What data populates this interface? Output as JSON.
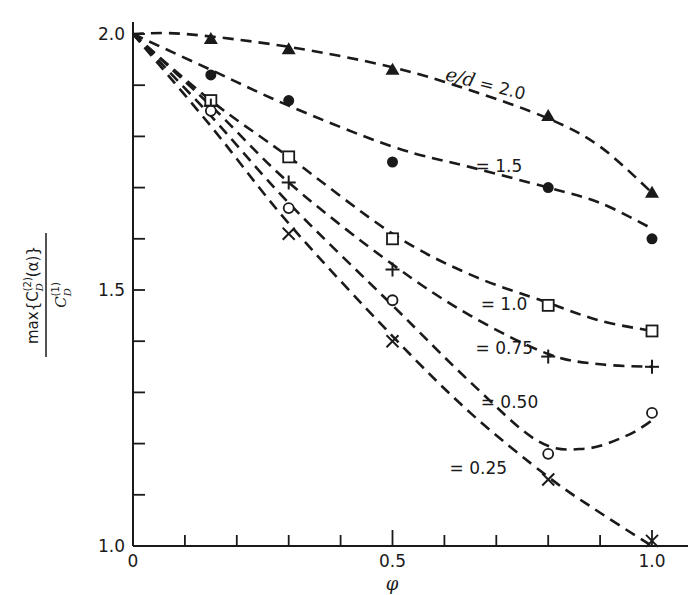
{
  "chart_data": {
    "type": "line",
    "title": "",
    "xlabel": "φ",
    "ylabel": "max{C_D^(2)(α)} / C_D^(1)",
    "ylabel_parts": {
      "numerator": "max{C",
      "num_sup": "(2)",
      "num_sub": "D",
      "num_tail": "(α)}",
      "denominator": "C",
      "den_sup": "(1)",
      "den_sub": "D"
    },
    "xlim": [
      0,
      1.0
    ],
    "ylim": [
      1.0,
      2.0
    ],
    "grid": false,
    "legend_position": "inline labels on curves",
    "x_ticks": [
      0,
      0.1,
      0.2,
      0.3,
      0.4,
      0.5,
      0.6,
      0.7,
      0.8,
      0.9,
      1.0
    ],
    "x_tick_labels": [
      {
        "value": 0,
        "label": "0"
      },
      {
        "value": 0.5,
        "label": "0.5"
      },
      {
        "value": 1.0,
        "label": "1.0"
      }
    ],
    "y_ticks": [
      1.0,
      1.1,
      1.2,
      1.3,
      1.4,
      1.5,
      1.6,
      1.7,
      1.8,
      1.9,
      2.0
    ],
    "y_tick_labels": [
      {
        "value": 1.0,
        "label": "1.0"
      },
      {
        "value": 1.5,
        "label": "1.5"
      },
      {
        "value": 2.0,
        "label": "2.0"
      }
    ],
    "x": [
      0.15,
      0.3,
      0.5,
      0.8,
      1.0
    ],
    "series": [
      {
        "name": "e/d = 2.0",
        "label": "e/d = 2.0",
        "marker": "filled-triangle",
        "values": [
          1.99,
          1.97,
          1.93,
          1.84,
          1.69
        ],
        "curve": [
          [
            0,
            2.0
          ],
          [
            0.1,
            2.0
          ],
          [
            0.3,
            1.975
          ],
          [
            0.5,
            1.935
          ],
          [
            0.65,
            1.89
          ],
          [
            0.8,
            1.835
          ],
          [
            0.9,
            1.78
          ],
          [
            1.0,
            1.69
          ]
        ]
      },
      {
        "name": "e/d = 1.5",
        "label": "= 1.5",
        "marker": "filled-circle",
        "values": [
          1.92,
          1.87,
          1.75,
          1.7,
          1.6
        ],
        "curve": [
          [
            0,
            2.0
          ],
          [
            0.15,
            1.93
          ],
          [
            0.3,
            1.86
          ],
          [
            0.5,
            1.78
          ],
          [
            0.65,
            1.74
          ],
          [
            0.8,
            1.7
          ],
          [
            0.9,
            1.67
          ],
          [
            1.0,
            1.62
          ]
        ]
      },
      {
        "name": "e/d = 1.0",
        "label": "= 1.0",
        "marker": "open-square",
        "values": [
          1.87,
          1.76,
          1.6,
          1.47,
          1.42
        ],
        "curve": [
          [
            0,
            2.0
          ],
          [
            0.15,
            1.87
          ],
          [
            0.3,
            1.76
          ],
          [
            0.5,
            1.61
          ],
          [
            0.65,
            1.53
          ],
          [
            0.8,
            1.475
          ],
          [
            0.9,
            1.44
          ],
          [
            1.0,
            1.42
          ]
        ]
      },
      {
        "name": "e/d = 0.75",
        "label": "= 0.75",
        "marker": "plus",
        "values": [
          1.86,
          1.71,
          1.54,
          1.37,
          1.35
        ],
        "curve": [
          [
            0,
            2.0
          ],
          [
            0.15,
            1.86
          ],
          [
            0.3,
            1.71
          ],
          [
            0.5,
            1.55
          ],
          [
            0.65,
            1.45
          ],
          [
            0.8,
            1.375
          ],
          [
            0.9,
            1.355
          ],
          [
            1.0,
            1.35
          ]
        ]
      },
      {
        "name": "e/d = 0.50",
        "label": "= 0.50",
        "marker": "open-circle",
        "values": [
          1.85,
          1.66,
          1.48,
          1.18,
          1.26
        ],
        "curve": [
          [
            0,
            2.0
          ],
          [
            0.15,
            1.84
          ],
          [
            0.3,
            1.67
          ],
          [
            0.5,
            1.47
          ],
          [
            0.65,
            1.32
          ],
          [
            0.78,
            1.205
          ],
          [
            0.87,
            1.19
          ],
          [
            0.95,
            1.215
          ],
          [
            1.0,
            1.245
          ]
        ]
      },
      {
        "name": "e/d = 0.25",
        "label": "= 0.25",
        "marker": "x-cross",
        "values": [
          null,
          1.61,
          1.4,
          1.13,
          1.01
        ],
        "curve": [
          [
            0,
            2.0
          ],
          [
            0.15,
            1.82
          ],
          [
            0.3,
            1.63
          ],
          [
            0.5,
            1.41
          ],
          [
            0.65,
            1.26
          ],
          [
            0.8,
            1.135
          ],
          [
            0.9,
            1.065
          ],
          [
            1.0,
            1.0
          ]
        ]
      }
    ],
    "annotations": [
      {
        "text": "e/d = 2.0",
        "x": 0.6,
        "y": 1.91,
        "rotation": 14
      },
      {
        "text": "= 1.5",
        "x": 0.66,
        "y": 1.73
      },
      {
        "text": "= 1.0",
        "x": 0.67,
        "y": 1.46
      },
      {
        "text": "= 0.75",
        "x": 0.66,
        "y": 1.375
      },
      {
        "text": "= 0.50",
        "x": 0.67,
        "y": 1.27
      },
      {
        "text": "= 0.25",
        "x": 0.61,
        "y": 1.14
      }
    ]
  },
  "colors": {
    "ink": "#1a1a1a",
    "background": "#ffffff"
  }
}
